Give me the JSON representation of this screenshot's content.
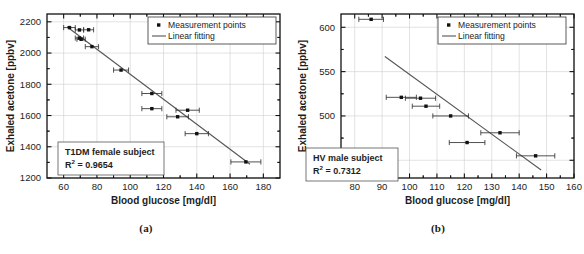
{
  "figure": {
    "panels": [
      {
        "caption": "(a)",
        "annotation_title": "T1DM female subject",
        "annotation_r2_prefix": "R",
        "annotation_r2_sup": "2",
        "annotation_r2_value": "= 0.9654",
        "legend": [
          {
            "label": "Measurement points",
            "marker": "square"
          },
          {
            "label": "Linear fitting",
            "marker": "line"
          }
        ]
      },
      {
        "caption": "(b)",
        "annotation_title": "HV male subject",
        "annotation_r2_prefix": "R",
        "annotation_r2_sup": "2",
        "annotation_r2_value": "= 0.7312",
        "legend": [
          {
            "label": "Measurement points",
            "marker": "square"
          },
          {
            "label": "Linear fitting",
            "marker": "line"
          }
        ]
      }
    ]
  },
  "chart_data": [
    {
      "type": "scatter",
      "title": "",
      "xlabel": "Blood glucose [mg/dl]",
      "ylabel": "Exhaled acetone [ppbv]",
      "xlim": [
        50,
        190
      ],
      "ylim": [
        1200,
        2250
      ],
      "xticks": [
        60,
        80,
        100,
        120,
        140,
        160,
        180
      ],
      "yticks": [
        1200,
        1400,
        1600,
        1800,
        2000,
        2200
      ],
      "grid": true,
      "legend_position": "top-right",
      "annotation": "T1DM female subject, R^2 = 0.9654",
      "r_squared": 0.9654,
      "series": [
        {
          "name": "Measurement points",
          "points": [
            {
              "x": 63.5,
              "y": 2163,
              "xerr": 3.5
            },
            {
              "x": 69.5,
              "y": 2148,
              "xerr": 2.5
            },
            {
              "x": 69.5,
              "y": 2096,
              "xerr": 2.5
            },
            {
              "x": 70.5,
              "y": 2088,
              "xerr": 2.5
            },
            {
              "x": 75.0,
              "y": 2149,
              "xerr": 3.0
            },
            {
              "x": 77.0,
              "y": 2041,
              "xerr": 4.0
            },
            {
              "x": 94.5,
              "y": 1891,
              "xerr": 4.5
            },
            {
              "x": 113.0,
              "y": 1741,
              "xerr": 6.0
            },
            {
              "x": 113.0,
              "y": 1644,
              "xerr": 6.0
            },
            {
              "x": 128.5,
              "y": 1592,
              "xerr": 6.5
            },
            {
              "x": 134.5,
              "y": 1634,
              "xerr": 7.0
            },
            {
              "x": 140.0,
              "y": 1484,
              "xerr": 7.0
            },
            {
              "x": 169.5,
              "y": 1303,
              "xerr": 9.0
            }
          ]
        },
        {
          "name": "Linear fitting",
          "type": "line",
          "x": [
            62,
            172
          ],
          "y": [
            2168,
            1288
          ]
        }
      ]
    },
    {
      "type": "scatter",
      "title": "",
      "xlabel": "Blood glucose [mg/dl]",
      "ylabel": "Exhaled acetone [ppbv]",
      "xlim": [
        75,
        160
      ],
      "ylim": [
        430,
        615
      ],
      "xticks": [
        80,
        90,
        100,
        110,
        120,
        130,
        140,
        150,
        160
      ],
      "yticks": [
        450,
        500,
        550,
        600
      ],
      "grid": true,
      "legend_position": "top-right",
      "annotation": "HV male subject, R^2 = 0.7312",
      "r_squared": 0.7312,
      "series": [
        {
          "name": "Measurement points",
          "points": [
            {
              "x": 86.0,
              "y": 609,
              "xerr": 4.5
            },
            {
              "x": 97.0,
              "y": 521,
              "xerr": 5.5
            },
            {
              "x": 104.0,
              "y": 520,
              "xerr": 5.5
            },
            {
              "x": 106.0,
              "y": 511,
              "xerr": 5.0
            },
            {
              "x": 115.0,
              "y": 500,
              "xerr": 6.5
            },
            {
              "x": 121.0,
              "y": 470,
              "xerr": 6.5
            },
            {
              "x": 133.0,
              "y": 481,
              "xerr": 7.0
            },
            {
              "x": 146.0,
              "y": 455,
              "xerr": 7.0
            }
          ]
        },
        {
          "name": "Linear fitting",
          "type": "line",
          "x": [
            91,
            148
          ],
          "y": [
            567,
            439
          ]
        }
      ]
    }
  ]
}
